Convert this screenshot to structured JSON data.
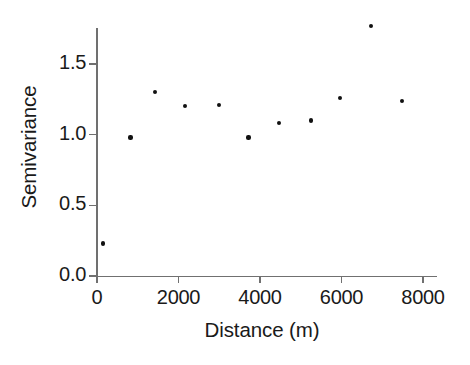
{
  "chart_data": {
    "type": "scatter",
    "title": "",
    "xlabel": "Distance (m)",
    "ylabel": "Semivariance",
    "xlim": [
      0,
      8400
    ],
    "ylim": [
      0.0,
      1.82
    ],
    "grid": false,
    "legend": null,
    "xticks": [
      0,
      2000,
      4000,
      6000,
      8000
    ],
    "xticklabels": [
      "0",
      "2000",
      "4000",
      "6000",
      "8000"
    ],
    "yticks": [
      0.0,
      0.5,
      1.0,
      1.5
    ],
    "yticklabels": [
      "0.0",
      "0.5",
      "1.0",
      "1.5"
    ],
    "marker": "dot",
    "marker_color": "#111111",
    "axis_color": "#707070",
    "x": [
      150,
      820,
      1430,
      2150,
      3000,
      3720,
      4460,
      5250,
      5970,
      6730,
      7480
    ],
    "y": [
      0.23,
      0.98,
      1.3,
      1.2,
      1.21,
      0.98,
      1.08,
      1.1,
      1.26,
      1.77,
      1.24
    ],
    "points": [
      {
        "x": 150,
        "y": 0.23
      },
      {
        "x": 820,
        "y": 0.98
      },
      {
        "x": 1430,
        "y": 1.3
      },
      {
        "x": 2150,
        "y": 1.2
      },
      {
        "x": 3000,
        "y": 1.21
      },
      {
        "x": 3720,
        "y": 0.98
      },
      {
        "x": 4460,
        "y": 1.08
      },
      {
        "x": 5250,
        "y": 1.1
      },
      {
        "x": 5970,
        "y": 1.26
      },
      {
        "x": 6730,
        "y": 1.77
      },
      {
        "x": 7480,
        "y": 1.24
      }
    ]
  }
}
